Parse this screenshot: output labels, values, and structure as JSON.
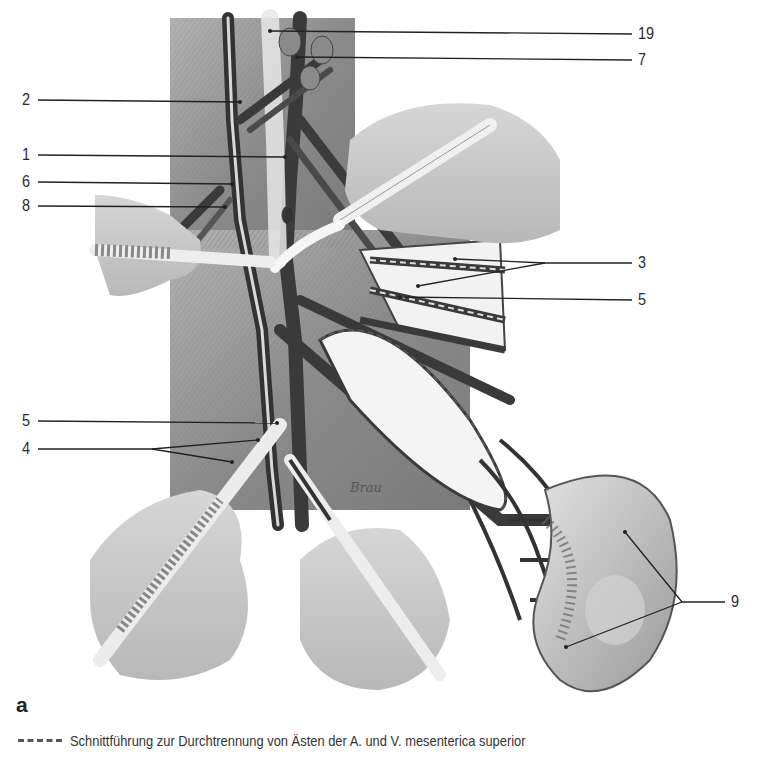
{
  "figure": {
    "panel_letter": "a",
    "labels_left": [
      {
        "id": "2",
        "text": "2"
      },
      {
        "id": "1",
        "text": "1"
      },
      {
        "id": "6",
        "text": "6"
      },
      {
        "id": "8",
        "text": "8"
      },
      {
        "id": "5b",
        "text": "5"
      },
      {
        "id": "4",
        "text": "4"
      }
    ],
    "labels_right": [
      {
        "id": "19",
        "text": "19"
      },
      {
        "id": "7",
        "text": "7"
      },
      {
        "id": "3",
        "text": "3"
      },
      {
        "id": "5a",
        "text": "5"
      },
      {
        "id": "9",
        "text": "9"
      }
    ],
    "signature": "Brau",
    "legend": {
      "symbol": "dashed-line",
      "text": "Schnittführung zur Durchtrennung  von Ästen der A. und V. mesenterica superior"
    },
    "colors": {
      "background": "#ffffff",
      "tissue_bg": "#9a9a9a",
      "vessel_dark": "#3a3a3a",
      "hand": "#c8c8c8",
      "instrument": "#ededed",
      "leader_line": "#222222"
    }
  }
}
